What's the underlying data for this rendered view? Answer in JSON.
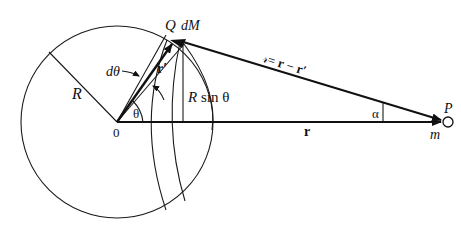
{
  "figure": {
    "labels": {
      "Q": "Q",
      "dM": "dM",
      "R_radius": "R",
      "d_theta": "dθ",
      "r_prime": "r′",
      "R_sin_theta": "R sin θ",
      "theta": "θ",
      "origin": "0",
      "r_vector": "r",
      "separation": "𝓇 = r − r′",
      "separation_script": "𝓇",
      "separation_eq": "= ",
      "separation_r": "r",
      "separation_minus": " − ",
      "separation_rprime": "r′",
      "alpha": "α",
      "P": "P",
      "m": "m"
    },
    "geometry": {
      "center": [
        117,
        122
      ],
      "radius": 96,
      "Q": [
        179,
        41
      ],
      "P": [
        448,
        122
      ]
    },
    "colors": {
      "line": "#111111",
      "background": "#ffffff"
    }
  }
}
